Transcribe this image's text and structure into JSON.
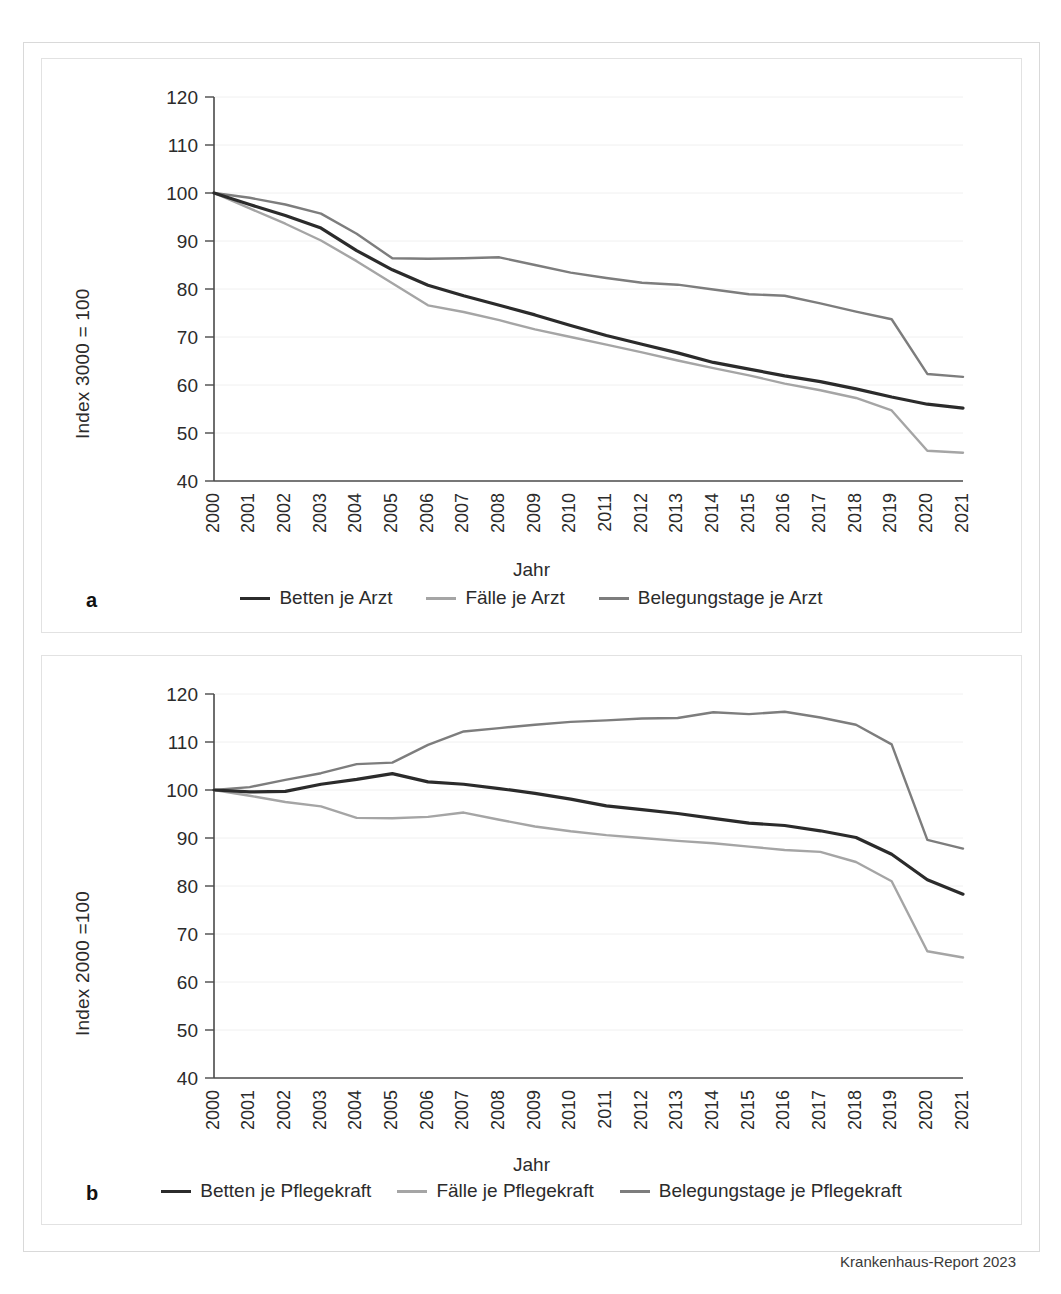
{
  "source_note": "Krankenhaus-Report 2023",
  "colors": {
    "series_dark": "#2b2b2b",
    "series_light": "#a5a5a5",
    "series_mid": "#7d7d7d",
    "axis": "#4a4a4a",
    "grid": "#f0f0f0",
    "panel_border": "#e2e2e2",
    "outer_border": "#d9d9d9"
  },
  "panels": [
    {
      "letter": "a",
      "ylabel": "Index 3000 = 100",
      "xlabel": "Jahr",
      "legend": [
        {
          "label": "Betten je Arzt",
          "color": "#2b2b2b"
        },
        {
          "label": "Fälle je Arzt",
          "color": "#a5a5a5"
        },
        {
          "label": "Belegungstage je Arzt",
          "color": "#7d7d7d"
        }
      ]
    },
    {
      "letter": "b",
      "ylabel": "Index 2000 =100",
      "xlabel": "Jahr",
      "legend": [
        {
          "label": "Betten je Pflegekraft",
          "color": "#2b2b2b"
        },
        {
          "label": "Fälle je Pflegekraft",
          "color": "#a5a5a5"
        },
        {
          "label": "Belegungstage je Pflegekraft",
          "color": "#7d7d7d"
        }
      ]
    }
  ],
  "chart_data": [
    {
      "type": "line",
      "title": "",
      "panel": "a",
      "xlabel": "Jahr",
      "ylabel": "Index 3000 = 100",
      "ylim": [
        40,
        120
      ],
      "yticks": [
        40,
        50,
        60,
        70,
        80,
        90,
        100,
        110,
        120
      ],
      "grid": true,
      "legend_position": "bottom",
      "categories": [
        2000,
        2001,
        2002,
        2003,
        2004,
        2005,
        2006,
        2007,
        2008,
        2009,
        2010,
        2011,
        2012,
        2013,
        2014,
        2015,
        2016,
        2017,
        2018,
        2019,
        2020,
        2021
      ],
      "series": [
        {
          "name": "Betten je Arzt",
          "color": "#2b2b2b",
          "values": [
            100.0,
            97.6,
            95.3,
            92.7,
            88.0,
            84.0,
            80.8,
            78.6,
            76.6,
            74.6,
            72.4,
            70.3,
            68.5,
            66.7,
            64.7,
            63.3,
            61.9,
            60.7,
            59.2,
            57.5,
            56.0,
            55.2
          ]
        },
        {
          "name": "Fälle je Arzt",
          "color": "#a5a5a5",
          "values": [
            100.0,
            96.8,
            93.6,
            90.1,
            85.8,
            81.2,
            76.6,
            75.2,
            73.5,
            71.6,
            70.0,
            68.4,
            66.8,
            65.1,
            63.5,
            62.0,
            60.3,
            58.9,
            57.3,
            54.7,
            46.3,
            45.9
          ]
        },
        {
          "name": "Belegungstage je Arzt",
          "color": "#7d7d7d",
          "values": [
            100.0,
            99.0,
            97.6,
            95.7,
            91.5,
            86.4,
            86.3,
            86.4,
            86.6,
            85.0,
            83.4,
            82.3,
            81.3,
            80.9,
            79.9,
            78.9,
            78.6,
            77.0,
            75.3,
            73.7,
            62.3,
            61.7
          ]
        }
      ]
    },
    {
      "type": "line",
      "title": "",
      "panel": "b",
      "xlabel": "Jahr",
      "ylabel": "Index 2000 =100",
      "ylim": [
        40,
        120
      ],
      "yticks": [
        40,
        50,
        60,
        70,
        80,
        90,
        100,
        110,
        120
      ],
      "grid": true,
      "legend_position": "bottom",
      "categories": [
        2000,
        2001,
        2002,
        2003,
        2004,
        2005,
        2006,
        2007,
        2008,
        2009,
        2010,
        2011,
        2012,
        2013,
        2014,
        2015,
        2016,
        2017,
        2018,
        2019,
        2020,
        2021
      ],
      "series": [
        {
          "name": "Betten je Pflegekraft",
          "color": "#2b2b2b",
          "values": [
            100.0,
            99.6,
            99.7,
            101.2,
            102.2,
            103.4,
            101.7,
            101.2,
            100.3,
            99.3,
            98.1,
            96.7,
            95.9,
            95.1,
            94.1,
            93.1,
            92.6,
            91.5,
            90.1,
            86.6,
            81.3,
            78.3
          ]
        },
        {
          "name": "Fälle je Pflegekraft",
          "color": "#a5a5a5",
          "values": [
            100.0,
            98.8,
            97.5,
            96.6,
            94.2,
            94.1,
            94.4,
            95.3,
            93.8,
            92.4,
            91.4,
            90.6,
            90.0,
            89.4,
            88.9,
            88.2,
            87.5,
            87.1,
            85.0,
            81.0,
            66.4,
            65.1
          ]
        },
        {
          "name": "Belegungstage je Pflegekraft",
          "color": "#7d7d7d",
          "values": [
            100.0,
            100.6,
            102.1,
            103.5,
            105.4,
            105.7,
            109.4,
            112.2,
            112.9,
            113.6,
            114.2,
            114.5,
            114.9,
            115.0,
            116.2,
            115.8,
            116.3,
            115.1,
            113.6,
            109.5,
            89.6,
            87.8
          ]
        }
      ]
    }
  ]
}
